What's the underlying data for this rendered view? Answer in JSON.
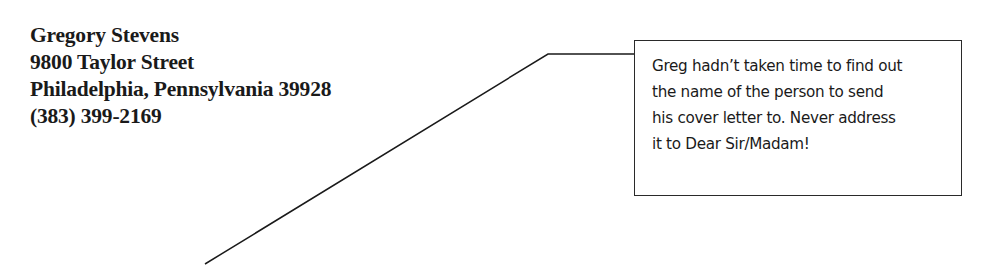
{
  "address": {
    "lines": [
      "Gregory Stevens",
      "9800 Taylor Street",
      "Philadelphia, Pennsylvania 39928",
      "(383) 399-2169"
    ]
  },
  "callout": {
    "lines": [
      "Greg hadn’t taken time to find out",
      "the name of the person to send",
      "his cover letter to. Never address",
      "it to Dear Sir/Madam!"
    ]
  }
}
